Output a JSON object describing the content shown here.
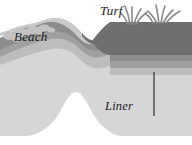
{
  "figure": {
    "kind": "cross-section-diagram",
    "background_color": "#ffffff",
    "caption": ""
  },
  "labels": {
    "beach": "Beach",
    "turf": "Turf",
    "liner": "Liner"
  },
  "leader_line": {
    "name": "liner-leader-line",
    "color": "#3c3c3c",
    "x": 154,
    "y_top": 72,
    "y_bottom": 116
  },
  "layers": [
    {
      "name": "turf-block",
      "label": "Turf",
      "color": "#6f6f6f"
    },
    {
      "name": "upper-soil-band",
      "label": "Upper soil",
      "color": "#8d8d8d"
    },
    {
      "name": "liner-band",
      "label": "Liner",
      "color": "#a0a0a0"
    },
    {
      "name": "bedding-band",
      "label": "Bedding sand",
      "color": "#bdbdbd"
    },
    {
      "name": "sand-body",
      "label": "Sand",
      "color": "#d6d6d6"
    },
    {
      "name": "core-void",
      "label": "Core",
      "color": "#ffffff"
    },
    {
      "name": "beach-surface",
      "label": "Beach",
      "color": "#c9c9c9"
    }
  ],
  "vegetation": {
    "name": "grass-tufts",
    "color": "#8a8a8a",
    "clump_count": 2,
    "blade_count": 11
  },
  "colors": {
    "darkest": "#6f6f6f",
    "dark": "#8d8d8d",
    "mid": "#a0a0a0",
    "light": "#bdbdbd",
    "lightest": "#d6d6d6",
    "void": "#ffffff",
    "label_text": "#1d1d1d"
  }
}
